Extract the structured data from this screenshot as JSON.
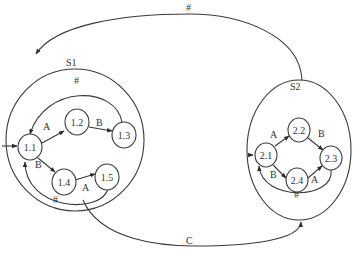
{
  "diagram": {
    "type": "hierarchical-state-machine",
    "superstates": [
      {
        "id": "S1",
        "label": "S1",
        "states": [
          "1.1",
          "1.2",
          "1.3",
          "1.4",
          "1.5"
        ]
      },
      {
        "id": "S2",
        "label": "S2",
        "states": [
          "2.1",
          "2.2",
          "2.3",
          "2.4"
        ]
      }
    ],
    "nodes": {
      "n11": "1.1",
      "n12": "1.2",
      "n13": "1.3",
      "n14": "1.4",
      "n15": "1.5",
      "n21": "2.1",
      "n22": "2.2",
      "n23": "2.3",
      "n24": "2.4"
    },
    "edges": {
      "e11_12": {
        "from": "1.1",
        "to": "1.2",
        "label": "A"
      },
      "e12_13": {
        "from": "1.2",
        "to": "1.3",
        "label": "B"
      },
      "e13_11": {
        "from": "1.3",
        "to": "1.1",
        "label": "#"
      },
      "e11_14": {
        "from": "1.1",
        "to": "1.4",
        "label": "B"
      },
      "e14_15": {
        "from": "1.4",
        "to": "1.5",
        "label": "A"
      },
      "e15_11": {
        "from": "1.5",
        "to": "1.1",
        "label": "#"
      },
      "e21_22": {
        "from": "2.1",
        "to": "2.2",
        "label": "A"
      },
      "e22_23": {
        "from": "2.2",
        "to": "2.3",
        "label": "B"
      },
      "e21_24": {
        "from": "2.1",
        "to": "2.4",
        "label": "B"
      },
      "e24_23": {
        "from": "2.4",
        "to": "2.3",
        "label": "A"
      },
      "e23_21": {
        "from": "2.3",
        "to": "2.1",
        "label": "#"
      },
      "eS2_S1": {
        "from": "S2",
        "to": "S1",
        "label": "#"
      },
      "eS1_S2": {
        "from": "S1",
        "to": "S2",
        "label": "C"
      }
    },
    "initial_entry": "1.1"
  }
}
